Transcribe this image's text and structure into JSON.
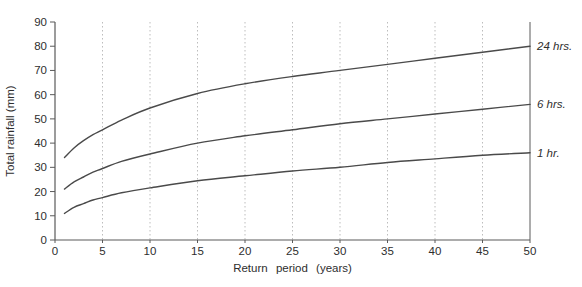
{
  "chart_data": {
    "type": "line",
    "title": "",
    "xlabel": "Return period (years)",
    "ylabel": "Total rainfall (mm)",
    "xlim": [
      0,
      50
    ],
    "ylim": [
      0,
      90
    ],
    "x_ticks": [
      0,
      5,
      10,
      15,
      20,
      25,
      30,
      35,
      40,
      45,
      50
    ],
    "y_ticks": [
      0,
      10,
      20,
      30,
      40,
      50,
      60,
      70,
      80,
      90
    ],
    "grid": "vertical-dotted-at-x-ticks",
    "right_border_at_x": 50,
    "legend_position": "end-of-curve-labels-right",
    "series": [
      {
        "name": "24 hrs.",
        "points": [
          [
            1,
            34
          ],
          [
            2,
            38
          ],
          [
            3,
            41
          ],
          [
            4,
            43.5
          ],
          [
            5,
            45.5
          ],
          [
            7,
            49.5
          ],
          [
            10,
            54.5
          ],
          [
            15,
            60.5
          ],
          [
            20,
            64.5
          ],
          [
            25,
            67.5
          ],
          [
            30,
            70
          ],
          [
            35,
            72.5
          ],
          [
            40,
            75
          ],
          [
            45,
            77.5
          ],
          [
            50,
            80
          ]
        ]
      },
      {
        "name": "6 hrs.",
        "points": [
          [
            1,
            21
          ],
          [
            2,
            24
          ],
          [
            3,
            26
          ],
          [
            4,
            28
          ],
          [
            5,
            29.5
          ],
          [
            7,
            32.5
          ],
          [
            10,
            35.5
          ],
          [
            15,
            40
          ],
          [
            20,
            43
          ],
          [
            25,
            45.5
          ],
          [
            30,
            48
          ],
          [
            35,
            50
          ],
          [
            40,
            52
          ],
          [
            45,
            54
          ],
          [
            50,
            56
          ]
        ]
      },
      {
        "name": "1 hr.",
        "points": [
          [
            1,
            11
          ],
          [
            2,
            13.5
          ],
          [
            3,
            15
          ],
          [
            4,
            16.5
          ],
          [
            5,
            17.5
          ],
          [
            7,
            19.5
          ],
          [
            10,
            21.5
          ],
          [
            15,
            24.5
          ],
          [
            20,
            26.5
          ],
          [
            25,
            28.5
          ],
          [
            30,
            30
          ],
          [
            35,
            32
          ],
          [
            40,
            33.5
          ],
          [
            45,
            35
          ],
          [
            50,
            36
          ]
        ]
      }
    ]
  },
  "colors": {
    "background": "#ffffff",
    "curve": "#4a4a4a",
    "grid": "#bdbdbd",
    "axis": "#5a5a5a",
    "text": "#2e2e2e"
  },
  "layout": {
    "width": 582,
    "height": 287,
    "plot_left": 55,
    "plot_right": 530,
    "plot_top": 22,
    "plot_bottom": 240
  }
}
